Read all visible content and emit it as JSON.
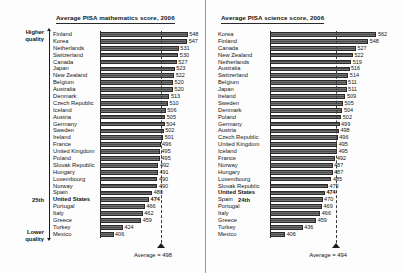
{
  "chart_data": [
    {
      "type": "bar",
      "orientation": "horizontal",
      "title": "Average PISA mathematics score, 2006",
      "xlabel": "",
      "ylabel": "",
      "xlim": [
        380,
        560
      ],
      "grid": false,
      "legend": null,
      "annotations": {
        "quality_top": "Higher quality",
        "quality_bottom": "Lower quality",
        "us_rank": "25th",
        "average_label": "Average = 498",
        "average_value": 498
      },
      "categories": [
        "Finland",
        "Korea",
        "Netherlands",
        "Switzerland",
        "Canada",
        "Japan",
        "New Zealand",
        "Belgium",
        "Australia",
        "Denmark",
        "Czech Republic",
        "Iceland",
        "Austria",
        "Germany",
        "Sweden",
        "Ireland",
        "France",
        "United Kingdom",
        "Poland",
        "Slovak Republic",
        "Hungary",
        "Luxembourg",
        "Norway",
        "Spain",
        "United States",
        "Portugal",
        "Italy",
        "Greece",
        "Turkey",
        "Mexico"
      ],
      "values": [
        548,
        547,
        531,
        530,
        527,
        523,
        522,
        520,
        520,
        513,
        510,
        506,
        505,
        504,
        502,
        501,
        496,
        495,
        495,
        492,
        491,
        490,
        490,
        480,
        474,
        466,
        462,
        459,
        424,
        406
      ],
      "highlight": "United States"
    },
    {
      "type": "bar",
      "orientation": "horizontal",
      "title": "Average PISA science score, 2006",
      "xlabel": "",
      "ylabel": "",
      "xlim": [
        380,
        575
      ],
      "grid": false,
      "legend": null,
      "annotations": {
        "us_rank": "24th",
        "average_label": "Average = 494",
        "average_value": 494
      },
      "categories": [
        "Korea",
        "Finland",
        "Canada",
        "New Zealand",
        "Netherlands",
        "Australia",
        "Switzerland",
        "Belgium",
        "Japan",
        "Ireland",
        "Sweden",
        "Denmark",
        "Poland",
        "Germany",
        "Austria",
        "Czech Republic",
        "United Kingdom",
        "Iceland",
        "France",
        "Norway",
        "Hungary",
        "Luxembourg",
        "Slovak Republic",
        "United States",
        "Spain",
        "Portugal",
        "Italy",
        "Greece",
        "Turkey",
        "Mexico"
      ],
      "values": [
        562,
        548,
        527,
        522,
        519,
        516,
        514,
        511,
        511,
        509,
        505,
        504,
        502,
        499,
        498,
        496,
        495,
        495,
        492,
        487,
        487,
        485,
        479,
        474,
        470,
        469,
        466,
        459,
        436,
        406
      ],
      "highlight": "United States"
    }
  ],
  "left": {
    "title": "Average PISA mathematics score, 2006",
    "quality_top_line1": "Higher",
    "quality_top_line2": "quality",
    "quality_bottom_line1": "Lower",
    "quality_bottom_line2": "quality",
    "us_rank": "25th",
    "average_label": "Average = 498"
  },
  "right": {
    "title": "Average PISA science score, 2006",
    "us_rank": "24th",
    "average_label": "Average = 494"
  },
  "colors": {
    "bar": "#4a4a4a",
    "bar_border": "#2a2a2a",
    "axis": "#1c1c1c",
    "text": "#141414",
    "background": "#fdfdfd"
  }
}
